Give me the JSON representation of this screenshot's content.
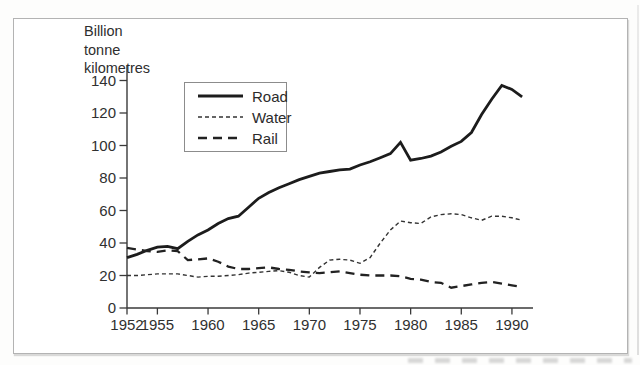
{
  "figure": {
    "unit_label": "Billion\ntonne\nkilometres"
  },
  "chart_data": {
    "type": "line",
    "title": "",
    "xlabel": "",
    "ylabel": "Billion tonne kilometres",
    "grid": false,
    "legend_position": "upper-left-inside",
    "xlim": [
      1952,
      1992
    ],
    "ylim": [
      0,
      149
    ],
    "yticks": [
      0,
      20,
      40,
      60,
      80,
      100,
      120,
      140
    ],
    "xticks": [
      1952,
      1955,
      1960,
      1965,
      1970,
      1975,
      1980,
      1985,
      1990
    ],
    "x": [
      1952,
      1953,
      1954,
      1955,
      1956,
      1957,
      1958,
      1959,
      1960,
      1961,
      1962,
      1963,
      1964,
      1965,
      1966,
      1967,
      1968,
      1969,
      1970,
      1971,
      1972,
      1973,
      1974,
      1975,
      1976,
      1977,
      1978,
      1979,
      1980,
      1981,
      1982,
      1983,
      1984,
      1985,
      1986,
      1987,
      1988,
      1989,
      1990,
      1991
    ],
    "series": [
      {
        "name": "Road",
        "style": "solid",
        "color": "#1c1c1c",
        "width": 2.8,
        "values": [
          31,
          33,
          35.5,
          37.5,
          38,
          36.5,
          41,
          45,
          48,
          52,
          55,
          56.5,
          62,
          67.5,
          71,
          74,
          76.5,
          79,
          81,
          83,
          84,
          85,
          85.5,
          88,
          90,
          92.5,
          95,
          102,
          91,
          92,
          93.5,
          96,
          99.5,
          102.5,
          108,
          119,
          128.5,
          137,
          134.5,
          130
        ]
      },
      {
        "name": "Water",
        "style": "short-dash",
        "color": "#333333",
        "width": 1.4,
        "values": [
          20,
          20,
          20.5,
          21,
          21,
          21,
          20,
          19,
          19.5,
          19.5,
          20,
          20.5,
          21.5,
          22,
          22.5,
          23,
          22,
          20,
          19,
          25,
          29.5,
          30,
          29.5,
          27.5,
          31,
          40,
          48,
          53.5,
          52.5,
          52,
          56,
          57.5,
          58,
          57.5,
          55.5,
          54,
          56.5,
          56.5,
          55.5,
          54
        ]
      },
      {
        "name": "Rail",
        "style": "long-dash",
        "color": "#222222",
        "width": 2.3,
        "values": [
          37,
          36,
          35,
          34.5,
          35.5,
          35,
          29.5,
          30,
          30.5,
          28.5,
          25.5,
          24,
          24,
          24.5,
          25,
          24,
          23.5,
          22.5,
          22,
          21.5,
          22,
          22.5,
          21.5,
          20.5,
          20,
          20,
          20,
          19.5,
          18,
          17.5,
          16,
          15.5,
          12.5,
          13.5,
          14.5,
          15.5,
          16,
          15,
          14,
          13
        ]
      }
    ]
  }
}
